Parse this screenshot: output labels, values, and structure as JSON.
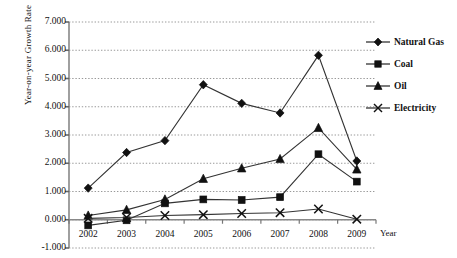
{
  "chart_data": {
    "type": "line",
    "title": "",
    "xlabel": "Year",
    "ylabel": "Year-on-year Growth Rate",
    "categories": [
      "2002",
      "2003",
      "2004",
      "2005",
      "2006",
      "2007",
      "2008",
      "2009"
    ],
    "ylim": [
      -1.0,
      7.0
    ],
    "ytick_step": 1.0,
    "yticks": [
      "7.000",
      "6.000",
      "5.000",
      "4.000",
      "3.000",
      "2.000",
      "1.000",
      "0.000",
      "-1.000"
    ],
    "ytick_values": [
      7.0,
      6.0,
      5.0,
      4.0,
      3.0,
      2.0,
      1.0,
      0.0,
      -1.0
    ],
    "grid": true,
    "grid_style": "dotted-horizontal",
    "legend_position": "right",
    "series": [
      {
        "name": "Natural Gas",
        "marker": "diamond",
        "values": [
          1.12,
          2.38,
          2.8,
          4.78,
          4.12,
          3.78,
          5.82,
          2.08
        ]
      },
      {
        "name": "Coal",
        "marker": "square",
        "values": [
          -0.2,
          -0.02,
          0.58,
          0.72,
          0.7,
          0.8,
          2.32,
          1.35
        ]
      },
      {
        "name": "Oil",
        "marker": "triangle",
        "values": [
          0.15,
          0.35,
          0.72,
          1.45,
          1.82,
          2.15,
          3.25,
          1.78
        ]
      },
      {
        "name": "Electricity",
        "marker": "cross",
        "values": [
          0.05,
          0.08,
          0.15,
          0.18,
          0.22,
          0.25,
          0.38,
          0.02
        ]
      }
    ]
  },
  "style": {
    "line_color": "#333333",
    "marker_color": "#111111",
    "grid_color": "#999999",
    "axis_color": "#777777",
    "background": "#ffffff"
  }
}
